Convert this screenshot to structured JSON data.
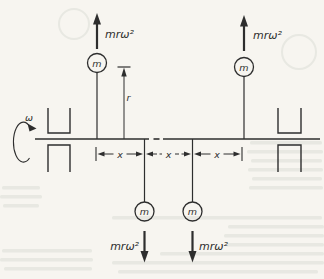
{
  "diagram": {
    "rotation_label": "ω",
    "radius_label": "r",
    "spacing_labels": [
      "x",
      "x",
      "x"
    ],
    "masses": {
      "top_left": {
        "label": "m",
        "force": "mrω²",
        "force_direction": "up"
      },
      "top_right": {
        "label": "m",
        "force": "mrω²",
        "force_direction": "up"
      },
      "bottom_left": {
        "label": "m",
        "force": "mrω²",
        "force_direction": "down"
      },
      "bottom_right": {
        "label": "m",
        "force": "mrω²",
        "force_direction": "down"
      }
    },
    "colors": {
      "ink": "#2e2e2e",
      "paper": "#f7f5f0",
      "bleed_through": "#7f9180"
    }
  }
}
